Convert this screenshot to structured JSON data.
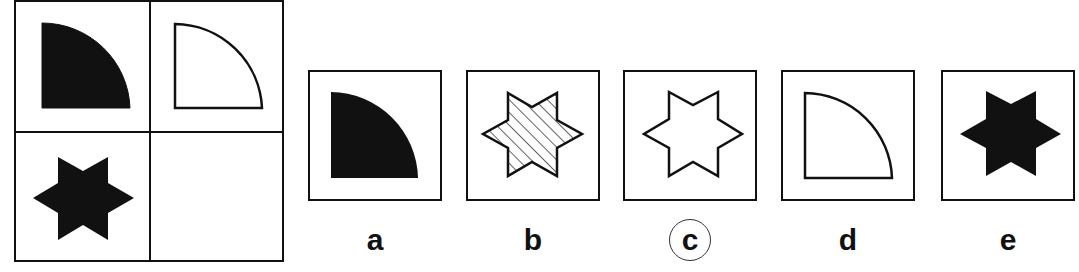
{
  "puzzle": {
    "type": "matrix-completion",
    "grid": {
      "rows": 2,
      "cols": 2,
      "cells": [
        {
          "position": "top-left",
          "shape": "quarter-circle",
          "fill": "solid-black"
        },
        {
          "position": "top-right",
          "shape": "quarter-circle",
          "fill": "white-outline"
        },
        {
          "position": "bottom-left",
          "shape": "six-point-star",
          "fill": "solid-black"
        },
        {
          "position": "bottom-right",
          "shape": "empty",
          "fill": "none"
        }
      ]
    },
    "options": [
      {
        "label": "a",
        "shape": "quarter-circle",
        "fill": "solid-black",
        "selected": false
      },
      {
        "label": "b",
        "shape": "six-point-star",
        "fill": "hatched",
        "selected": false
      },
      {
        "label": "c",
        "shape": "six-point-star",
        "fill": "white-outline",
        "selected": true
      },
      {
        "label": "d",
        "shape": "quarter-circle",
        "fill": "white-outline",
        "selected": false
      },
      {
        "label": "e",
        "shape": "six-point-star",
        "fill": "solid-black",
        "selected": false
      }
    ],
    "answer": "c"
  }
}
